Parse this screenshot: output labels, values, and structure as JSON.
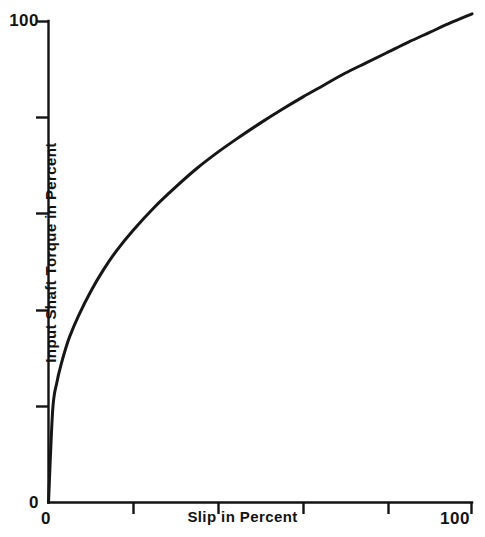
{
  "figure": {
    "background_color": "#ffffff",
    "ink_color": "#131313",
    "caption_text": ""
  },
  "axes": {
    "x": {
      "title": "Slip in Percent",
      "min_label": "0",
      "max_label": "100",
      "range": [
        0,
        100
      ],
      "tick_values": [
        0,
        20,
        40,
        60,
        80,
        100
      ],
      "labeled_ticks": [
        0,
        100
      ]
    },
    "y": {
      "title": "Input Shaft Torque in Percent",
      "min_label": "0",
      "max_label": "100",
      "range": [
        0,
        100
      ],
      "tick_values": [
        0,
        20,
        40,
        60,
        80,
        100
      ],
      "labeled_ticks": [
        0,
        100
      ]
    }
  },
  "chart_data": {
    "type": "line",
    "title": "",
    "xlabel": "Slip in Percent",
    "ylabel": "Input Shaft Torque in Percent",
    "xlim": [
      0,
      100
    ],
    "ylim": [
      0,
      100
    ],
    "grid": false,
    "legend": false,
    "series": [
      {
        "name": "Input Shaft Torque",
        "x": [
          0,
          1,
          2,
          3,
          4,
          5,
          7,
          10,
          13,
          16,
          20,
          25,
          30,
          35,
          40,
          45,
          50,
          55,
          60,
          65,
          70,
          75,
          80,
          85,
          90,
          95,
          100
        ],
        "values": [
          0,
          12.5,
          16.2,
          18.6,
          20.6,
          22.3,
          25.0,
          28.4,
          31.3,
          33.8,
          36.6,
          39.7,
          42.4,
          44.9,
          47.1,
          49.1,
          51.0,
          52.8,
          54.5,
          56.1,
          57.7,
          59.1,
          60.5,
          61.9,
          63.2,
          64.5,
          65.7
        ]
      }
    ]
  }
}
